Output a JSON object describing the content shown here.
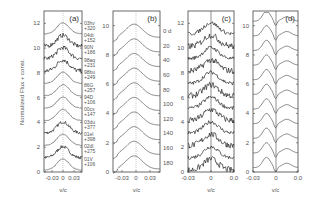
{
  "chart_data": [
    {
      "type": "line",
      "panel": "(a)",
      "xlabel": "v/c",
      "ylabel": "Normalized Flux + const.",
      "xticks": [
        "-0.03",
        "0",
        "0.03"
      ],
      "yticks": [
        "0",
        "2",
        "4",
        "6",
        "8",
        "10",
        "12"
      ],
      "ylim": [
        0,
        13
      ],
      "zero_line": "dotted",
      "series": [
        {
          "name": "01V",
          "phase": "+106",
          "offset": 0
        },
        {
          "name": "02dl",
          "phase": "+275",
          "offset": 1
        },
        {
          "name": "01el",
          "phase": "+398",
          "offset": 2
        },
        {
          "name": "03du",
          "phase": "+377",
          "offset": 3
        },
        {
          "name": "00cx",
          "phase": "+147",
          "offset": 4
        },
        {
          "name": "94D",
          "phase": "+106",
          "offset": 5
        },
        {
          "name": "86G",
          "phase": "+257",
          "offset": 6
        },
        {
          "name": "98bu",
          "phase": "+249",
          "offset": 7
        },
        {
          "name": "98aq",
          "phase": "+231",
          "offset": 8
        },
        {
          "name": "90N",
          "phase": "+186",
          "offset": 9
        },
        {
          "name": "04dt",
          "phase": "+152",
          "offset": 10
        },
        {
          "name": "03hv",
          "phase": "+320",
          "offset": 11
        }
      ]
    },
    {
      "type": "line",
      "panel": "(b)",
      "xlabel": "v/c",
      "xticks": [
        "-0.03",
        "0",
        "0.03"
      ],
      "yticks": [
        "0",
        "2",
        "4",
        "6",
        "8",
        "10"
      ],
      "ylim": [
        0,
        11
      ],
      "series_labels": [
        "0 d",
        "20",
        "40",
        "60",
        "80",
        "100",
        "120",
        "140",
        "160",
        "180"
      ]
    },
    {
      "type": "line",
      "panel": "(c)",
      "xlabel": "v/c",
      "xticks": [
        "-0.03",
        "0",
        "0.0"
      ],
      "yticks": [
        "0",
        "2",
        "4",
        "6",
        "8",
        "10",
        "12"
      ],
      "ylim": [
        0,
        13
      ],
      "zero_line": "solid",
      "n_series": 12
    },
    {
      "type": "line",
      "panel": "(d)",
      "xlabel": "v/c",
      "xticks": [
        "-0.03",
        "0",
        "0.0"
      ],
      "yticks": [
        "0",
        "2",
        "4",
        "6",
        "8",
        "10"
      ],
      "ylim": [
        0,
        11
      ],
      "zero_line": "solid",
      "n_series": 11
    }
  ],
  "labels": {
    "ylabel": "Normalized Flux + const.",
    "xlabel": "v/c",
    "a": "(a)",
    "b": "(b)",
    "c": "(c)",
    "d": "(d)"
  }
}
